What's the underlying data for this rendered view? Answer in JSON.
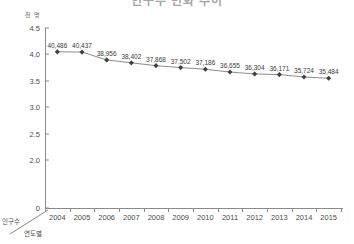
{
  "title": "인구수 변화 추이",
  "unit_label": "천 명",
  "corner": {
    "top_label": "인구수",
    "bottom_label": "연도별"
  },
  "axis": {
    "y_ticks": [
      "4.5",
      "4.0",
      "3.5",
      "3.0",
      "2.5",
      "2.0",
      "0"
    ],
    "x_ticks": [
      "2004",
      "2005",
      "2006",
      "2007",
      "2008",
      "2009",
      "2010",
      "2011",
      "2012",
      "2013",
      "2014",
      "2015"
    ]
  },
  "colors": {
    "line": "#8c8c8c",
    "marker": "#404040",
    "axis": "#8a8a8a",
    "text": "#3c3c3c"
  },
  "chart_data": {
    "type": "line",
    "title": "인구수 변화 추이",
    "xlabel": "연도별",
    "ylabel": "인구수",
    "unit": "천 명",
    "categories": [
      "2004",
      "2005",
      "2006",
      "2007",
      "2008",
      "2009",
      "2010",
      "2011",
      "2012",
      "2013",
      "2014",
      "2015"
    ],
    "values": [
      40486,
      40437,
      38956,
      38402,
      37868,
      37502,
      37186,
      36655,
      36304,
      36171,
      35724,
      35484
    ],
    "point_labels": [
      "40,486",
      "40,437",
      "38,956",
      "38,402",
      "37,868",
      "37,502",
      "37,186",
      "36,655",
      "36,304",
      "36,171",
      "35,724",
      "35,484"
    ],
    "ylim": [
      2.0,
      4.5
    ],
    "y_axis_scale_note": "값은 만 명 단위로 표시 (예: 40,486 → 4.0)",
    "y_axis_break": true,
    "y_tick_values": [
      4.5,
      4.0,
      3.5,
      3.0,
      2.5,
      2.0,
      0
    ],
    "grid": false,
    "legend": "none",
    "markers": "diamond"
  }
}
